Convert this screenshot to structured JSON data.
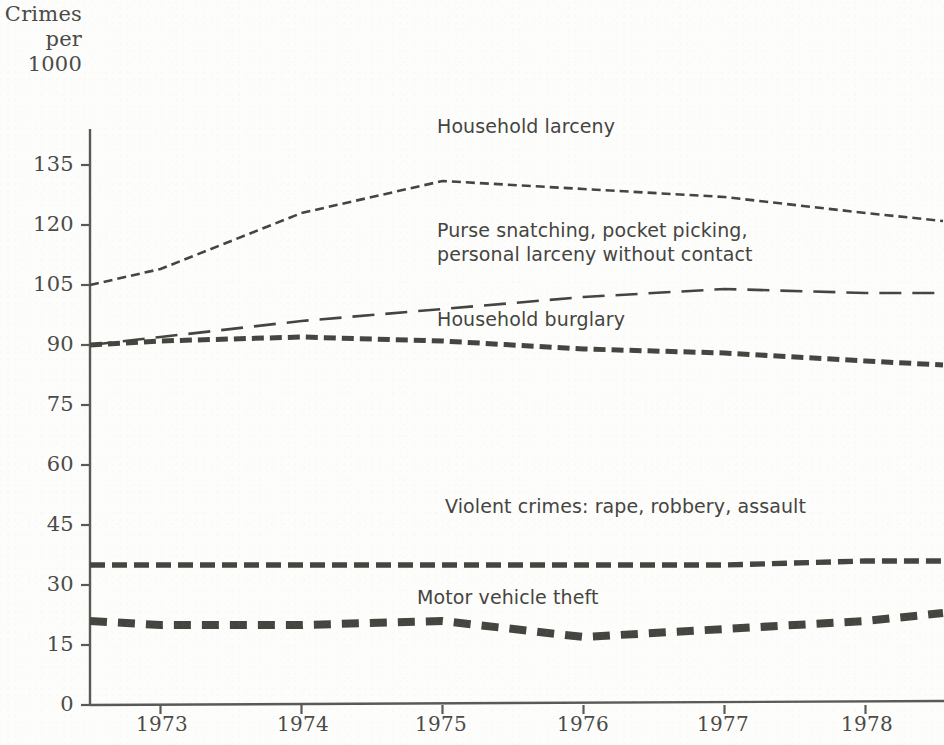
{
  "axis_title_lines": [
    "Crimes",
    "per",
    "1000"
  ],
  "labels": {
    "household_larceny": "Household larceny",
    "purse_line1": "Purse snatching, pocket picking,",
    "purse_line2": "personal larceny without contact",
    "household_burglary": "Household burglary",
    "violent": "Violent crimes: rape, robbery, assault",
    "motor": "Motor vehicle theft"
  },
  "colors": {
    "ink": "#45443f",
    "axis": "#5a5954",
    "paper": "#fdfdfc"
  },
  "chart_data": {
    "type": "line",
    "title": "",
    "xlabel": "",
    "ylabel": "Crimes per 1000",
    "ylim": [
      0,
      142
    ],
    "xlim": [
      1972.5,
      1978.55
    ],
    "grid": false,
    "legend": "inline-annotations",
    "yticks": [
      0,
      15,
      30,
      45,
      60,
      75,
      90,
      105,
      120,
      135
    ],
    "ytick_labels": [
      "0",
      "15",
      "30",
      "45",
      "60",
      "75",
      "90",
      "105",
      "120",
      "135"
    ],
    "xticks": [
      1973,
      1974,
      1975,
      1976,
      1977,
      1978
    ],
    "xtick_labels": [
      "1973",
      "1974",
      "1975",
      "1976",
      "1977",
      "1978"
    ],
    "x": [
      1972.5,
      1973,
      1974,
      1975,
      1976,
      1977,
      1978,
      1978.55
    ],
    "series": [
      {
        "name": "Household larceny",
        "dash": "fine-dot",
        "values": [
          105,
          109,
          123,
          131,
          129,
          127,
          123,
          121
        ]
      },
      {
        "name": "Purse snatching, pocket picking, personal larceny without contact",
        "dash": "long-dash",
        "values": [
          90,
          92,
          96,
          99,
          102,
          104,
          103,
          103
        ]
      },
      {
        "name": "Household burglary",
        "dash": "short-dash",
        "values": [
          90,
          91,
          92,
          91,
          89,
          88,
          86,
          85
        ]
      },
      {
        "name": "Violent crimes: rape, robbery, assault",
        "dash": "medium-dash",
        "values": [
          35,
          35,
          35,
          35,
          35,
          35,
          36,
          36
        ]
      },
      {
        "name": "Motor vehicle theft",
        "dash": "thick-dash",
        "values": [
          21,
          20,
          20,
          21,
          17,
          19,
          21,
          23
        ]
      }
    ]
  }
}
